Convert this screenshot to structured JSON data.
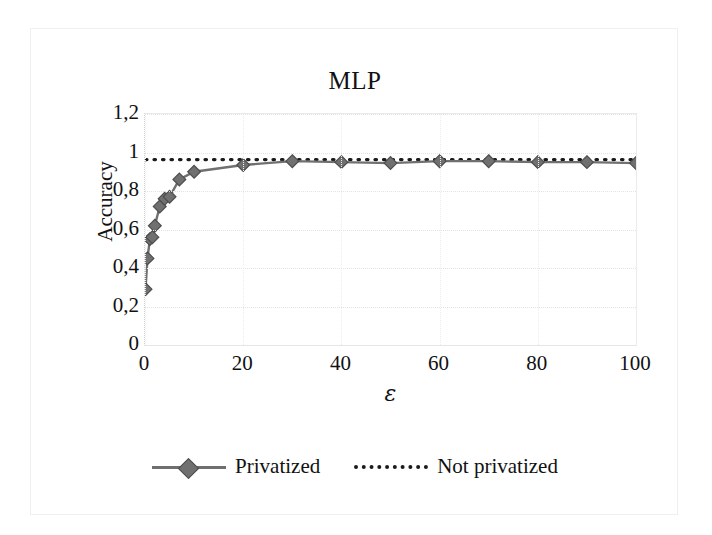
{
  "chart_data": {
    "type": "line",
    "title": "MLP",
    "xlabel": "ε",
    "ylabel": "Accuracy",
    "xlim": [
      0,
      100
    ],
    "ylim": [
      0,
      1.2
    ],
    "grid": true,
    "legend_position": "bottom",
    "x_ticks": [
      "0",
      "20",
      "40",
      "60",
      "80",
      "100"
    ],
    "x_tick_values": [
      0,
      20,
      40,
      60,
      80,
      100
    ],
    "y_ticks": [
      "0",
      "0,2",
      "0,4",
      "0,6",
      "0,8",
      "1",
      "1,2"
    ],
    "y_tick_values": [
      0,
      0.2,
      0.4,
      0.6,
      0.8,
      1,
      1.2
    ],
    "series": [
      {
        "name": "Privatized",
        "marker": "diamond",
        "color": "#707070",
        "line_style": "solid",
        "x": [
          0.1,
          0.5,
          1,
          1.5,
          2,
          3,
          4,
          5,
          7,
          10,
          20,
          30,
          40,
          50,
          60,
          70,
          80,
          90,
          100
        ],
        "values": [
          0.29,
          0.45,
          0.55,
          0.56,
          0.62,
          0.72,
          0.76,
          0.77,
          0.86,
          0.9,
          0.935,
          0.955,
          0.95,
          0.945,
          0.955,
          0.955,
          0.95,
          0.95,
          0.945
        ]
      },
      {
        "name": "Not privatized",
        "marker": "none",
        "color": "#1b1b1b",
        "line_style": "dotted",
        "x": [
          0.1,
          10,
          20,
          30,
          40,
          50,
          60,
          70,
          80,
          90,
          100
        ],
        "values": [
          0.963,
          0.963,
          0.963,
          0.963,
          0.963,
          0.963,
          0.963,
          0.963,
          0.963,
          0.963,
          0.963
        ]
      }
    ]
  },
  "legend": {
    "privatized_label": "Privatized",
    "not_privatized_label": "Not privatized"
  }
}
